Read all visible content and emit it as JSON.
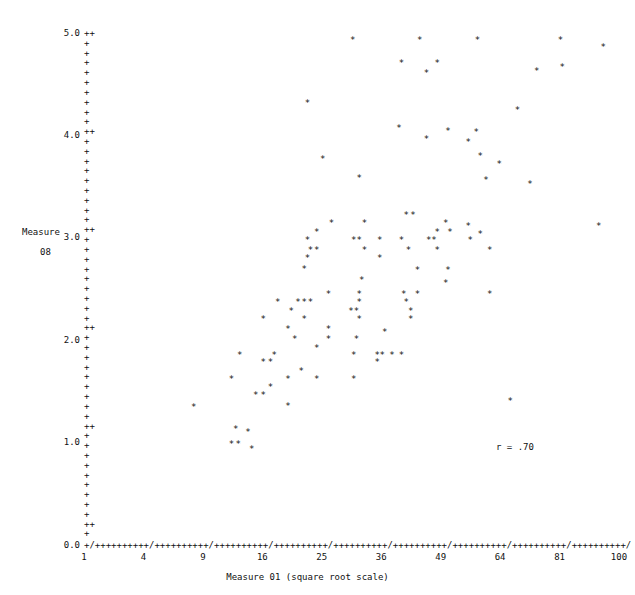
{
  "chart_data": {
    "type": "scatter",
    "title": "",
    "xlabel": "Measure 01 (square root scale)",
    "ylabel": "Measure 08",
    "ylabel_lines": [
      "Measure",
      "08"
    ],
    "annotation": "r = .70",
    "correlation": 0.7,
    "grid": false,
    "legend": "none",
    "point_glyph": "*",
    "axis_glyph_major": "/",
    "axis_glyph_minor": "+",
    "xlim": [
      1,
      100
    ],
    "ylim": [
      0.0,
      5.0
    ],
    "x_scale": "square root",
    "xticks": [
      1,
      4,
      9,
      16,
      25,
      36,
      49,
      64,
      81,
      100
    ],
    "xtick_labels": [
      "1",
      "4",
      "9",
      "16",
      "25",
      "36",
      "49",
      "64",
      "81",
      "100"
    ],
    "yticks": [
      0.0,
      1.0,
      2.0,
      3.0,
      4.0,
      5.0
    ],
    "ytick_labels": [
      "0.0",
      "1.0",
      "2.0",
      "3.0",
      "4.0",
      "5.0"
    ],
    "ytick_major_suffix": "++",
    "ytick_zero_suffix": "+",
    "x_axis_string": "+/++++++++++/++++++++++/++++++++++/++++++++++/++++++++++/++++++++++/++++++++++/++++++++++/++++++++++/",
    "points": [
      {
        "x": 30.3,
        "y": 4.93
      },
      {
        "x": 44.0,
        "y": 4.93
      },
      {
        "x": 57.8,
        "y": 4.93
      },
      {
        "x": 81.0,
        "y": 4.93
      },
      {
        "x": 94.5,
        "y": 4.86
      },
      {
        "x": 40.0,
        "y": 4.7
      },
      {
        "x": 48.0,
        "y": 4.7
      },
      {
        "x": 81.5,
        "y": 4.66
      },
      {
        "x": 45.5,
        "y": 4.6
      },
      {
        "x": 74.0,
        "y": 4.62
      },
      {
        "x": 22.5,
        "y": 4.31
      },
      {
        "x": 68.5,
        "y": 4.24
      },
      {
        "x": 39.5,
        "y": 4.07
      },
      {
        "x": 50.5,
        "y": 4.04
      },
      {
        "x": 57.5,
        "y": 4.03
      },
      {
        "x": 45.5,
        "y": 3.96
      },
      {
        "x": 55.5,
        "y": 3.93
      },
      {
        "x": 25.0,
        "y": 3.76
      },
      {
        "x": 58.5,
        "y": 3.79
      },
      {
        "x": 63.5,
        "y": 3.72
      },
      {
        "x": 31.5,
        "y": 3.58
      },
      {
        "x": 60.0,
        "y": 3.56
      },
      {
        "x": 72.0,
        "y": 3.52
      },
      {
        "x": 41.0,
        "y": 3.22
      },
      {
        "x": 42.5,
        "y": 3.22
      },
      {
        "x": 26.5,
        "y": 3.14
      },
      {
        "x": 32.5,
        "y": 3.14
      },
      {
        "x": 50.0,
        "y": 3.14
      },
      {
        "x": 55.5,
        "y": 3.11
      },
      {
        "x": 93.0,
        "y": 3.11
      },
      {
        "x": 24.0,
        "y": 3.05
      },
      {
        "x": 48.0,
        "y": 3.05
      },
      {
        "x": 51.0,
        "y": 3.05
      },
      {
        "x": 58.5,
        "y": 3.03
      },
      {
        "x": 22.5,
        "y": 2.97
      },
      {
        "x": 30.5,
        "y": 2.97
      },
      {
        "x": 31.5,
        "y": 2.97
      },
      {
        "x": 35.5,
        "y": 2.97
      },
      {
        "x": 40.0,
        "y": 2.97
      },
      {
        "x": 46.0,
        "y": 2.97
      },
      {
        "x": 47.2,
        "y": 2.97
      },
      {
        "x": 56.0,
        "y": 2.97
      },
      {
        "x": 23.0,
        "y": 2.88
      },
      {
        "x": 24.0,
        "y": 2.88
      },
      {
        "x": 32.5,
        "y": 2.88
      },
      {
        "x": 41.5,
        "y": 2.88
      },
      {
        "x": 48.0,
        "y": 2.88
      },
      {
        "x": 61.0,
        "y": 2.88
      },
      {
        "x": 22.5,
        "y": 2.8
      },
      {
        "x": 35.5,
        "y": 2.8
      },
      {
        "x": 22.0,
        "y": 2.69
      },
      {
        "x": 43.5,
        "y": 2.68
      },
      {
        "x": 50.5,
        "y": 2.68
      },
      {
        "x": 32.0,
        "y": 2.58
      },
      {
        "x": 50.0,
        "y": 2.55
      },
      {
        "x": 26.0,
        "y": 2.45
      },
      {
        "x": 31.5,
        "y": 2.45
      },
      {
        "x": 40.5,
        "y": 2.45
      },
      {
        "x": 43.5,
        "y": 2.45
      },
      {
        "x": 61.0,
        "y": 2.45
      },
      {
        "x": 18.0,
        "y": 2.37
      },
      {
        "x": 21.0,
        "y": 2.37
      },
      {
        "x": 22.0,
        "y": 2.37
      },
      {
        "x": 23.0,
        "y": 2.37
      },
      {
        "x": 31.5,
        "y": 2.37
      },
      {
        "x": 41.0,
        "y": 2.37
      },
      {
        "x": 20.0,
        "y": 2.28
      },
      {
        "x": 30.0,
        "y": 2.28
      },
      {
        "x": 31.0,
        "y": 2.28
      },
      {
        "x": 42.0,
        "y": 2.28
      },
      {
        "x": 16.0,
        "y": 2.2
      },
      {
        "x": 22.0,
        "y": 2.2
      },
      {
        "x": 31.5,
        "y": 2.2
      },
      {
        "x": 42.0,
        "y": 2.2
      },
      {
        "x": 19.5,
        "y": 2.1
      },
      {
        "x": 26.0,
        "y": 2.1
      },
      {
        "x": 36.5,
        "y": 2.08
      },
      {
        "x": 20.5,
        "y": 2.01
      },
      {
        "x": 26.0,
        "y": 2.01
      },
      {
        "x": 31.0,
        "y": 2.01
      },
      {
        "x": 24.0,
        "y": 1.92
      },
      {
        "x": 13.0,
        "y": 1.85
      },
      {
        "x": 17.5,
        "y": 1.85
      },
      {
        "x": 30.5,
        "y": 1.85
      },
      {
        "x": 35.0,
        "y": 1.85
      },
      {
        "x": 36.0,
        "y": 1.85
      },
      {
        "x": 38.0,
        "y": 1.85
      },
      {
        "x": 40.0,
        "y": 1.85
      },
      {
        "x": 16.0,
        "y": 1.78
      },
      {
        "x": 17.0,
        "y": 1.78
      },
      {
        "x": 35.0,
        "y": 1.78
      },
      {
        "x": 21.5,
        "y": 1.69
      },
      {
        "x": 12.0,
        "y": 1.62
      },
      {
        "x": 19.5,
        "y": 1.62
      },
      {
        "x": 24.0,
        "y": 1.62
      },
      {
        "x": 30.5,
        "y": 1.62
      },
      {
        "x": 17.0,
        "y": 1.54
      },
      {
        "x": 15.0,
        "y": 1.46
      },
      {
        "x": 16.0,
        "y": 1.46
      },
      {
        "x": 19.5,
        "y": 1.35
      },
      {
        "x": 66.5,
        "y": 1.4
      },
      {
        "x": 8.0,
        "y": 1.34
      },
      {
        "x": 12.5,
        "y": 1.13
      },
      {
        "x": 14.0,
        "y": 1.1
      },
      {
        "x": 12.0,
        "y": 0.98
      },
      {
        "x": 12.8,
        "y": 0.98
      },
      {
        "x": 14.5,
        "y": 0.93
      }
    ]
  }
}
